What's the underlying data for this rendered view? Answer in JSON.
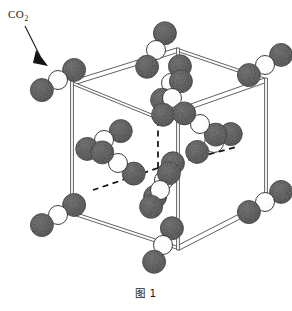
{
  "figure": {
    "caption": "图 1",
    "annotation": {
      "label_main": "CO",
      "label_sub": "2",
      "full": "CO₂",
      "pointer": "arrow pointing down-right to the upper-left corner molecule"
    },
    "structure_type": "face-centered cubic (FCC) unit cell of solid CO2 (dry ice)",
    "colors": {
      "oxygen_sphere": "#4d4d4d",
      "oxygen_sphere_dark": "#3a3a3a",
      "carbon_sphere": "#ffffff",
      "sphere_outline": "#2b2b2b",
      "cell_edge": "#4a4a4a",
      "hidden_edge_dashed": "#111111",
      "background": "#ffffff",
      "text": "#1d1d1d"
    },
    "counts": {
      "corner_molecules": 8,
      "face_center_molecules": 6,
      "total_molecules_drawn": 14,
      "atoms_per_molecule": 3
    },
    "legend_keys": {
      "dark_sphere_means": "O 氧原子",
      "white_sphere_means": "C 碳原子"
    },
    "cube_vertices_px": {
      "front_top_left": [
        72,
        83
      ],
      "front_top_right": [
        178,
        50
      ],
      "back_top_right": [
        266,
        80
      ],
      "back_top_left": [
        158,
        118
      ],
      "front_bottom_left": [
        72,
        213
      ],
      "front_bottom_right": [
        178,
        248
      ],
      "back_bottom_right": [
        266,
        203
      ],
      "back_bottom_left": [
        158,
        168
      ]
    },
    "molecules": [
      {
        "id": "corner-ftl",
        "site": "corner",
        "center": [
          58,
          80
        ],
        "angle": 32,
        "len": 19,
        "r_o": 11.5,
        "r_c": 9.5
      },
      {
        "id": "corner-ftr",
        "site": "corner",
        "center": [
          156,
          50
        ],
        "angle": 62,
        "len": 19,
        "r_o": 11.5,
        "r_c": 9.5
      },
      {
        "id": "corner-btr",
        "site": "corner",
        "center": [
          265,
          65
        ],
        "angle": 32,
        "len": 19,
        "r_o": 11.5,
        "r_c": 9.5
      },
      {
        "id": "corner-btl",
        "site": "corner",
        "center": [
          171,
          83
        ],
        "angle": 62,
        "len": 19,
        "r_o": 11.5,
        "r_c": 9.5
      },
      {
        "id": "corner-fbl",
        "site": "corner",
        "center": [
          58,
          215
        ],
        "angle": 32,
        "len": 19,
        "r_o": 11.5,
        "r_c": 9.5
      },
      {
        "id": "corner-fbr",
        "site": "corner",
        "center": [
          163,
          245
        ],
        "angle": 62,
        "len": 19,
        "r_o": 11.5,
        "r_c": 9.5
      },
      {
        "id": "corner-bbr",
        "site": "corner",
        "center": [
          265,
          202
        ],
        "angle": 32,
        "len": 19,
        "r_o": 11.5,
        "r_c": 9.5
      },
      {
        "id": "corner-bbl",
        "site": "corner",
        "center": [
          164,
          180
        ],
        "angle": 62,
        "len": 19,
        "r_o": 11.5,
        "r_c": 9.5
      },
      {
        "id": "face-left",
        "site": "face-center",
        "center": [
          104,
          140
        ],
        "angle": 28,
        "len": 19,
        "r_o": 11.5,
        "r_c": 9.5
      },
      {
        "id": "face-front",
        "site": "face-center",
        "center": [
          118,
          163
        ],
        "angle": -34,
        "len": 19,
        "r_o": 11.5,
        "r_c": 9.5
      },
      {
        "id": "face-top",
        "site": "face-center",
        "center": [
          172,
          98
        ],
        "angle": 62,
        "len": 19,
        "r_o": 11.5,
        "r_c": 9.5
      },
      {
        "id": "face-right",
        "site": "face-center",
        "center": [
          214,
          143
        ],
        "angle": 28,
        "len": 19,
        "r_o": 11.5,
        "r_c": 9.5
      },
      {
        "id": "face-back",
        "site": "face-center",
        "center": [
          200,
          124
        ],
        "angle": -34,
        "len": 19,
        "r_o": 11.5,
        "r_c": 9.5
      },
      {
        "id": "face-bottom",
        "site": "face-center",
        "center": [
          160,
          190
        ],
        "angle": 62,
        "len": 19,
        "r_o": 11.5,
        "r_c": 9.5
      }
    ],
    "arrow": {
      "start": [
        22,
        22
      ],
      "end": [
        43,
        60
      ],
      "head_size": 9
    },
    "label_pos": {
      "x": 8,
      "y": 17
    },
    "caption_pos": {
      "x": 146,
      "y": 297
    }
  }
}
